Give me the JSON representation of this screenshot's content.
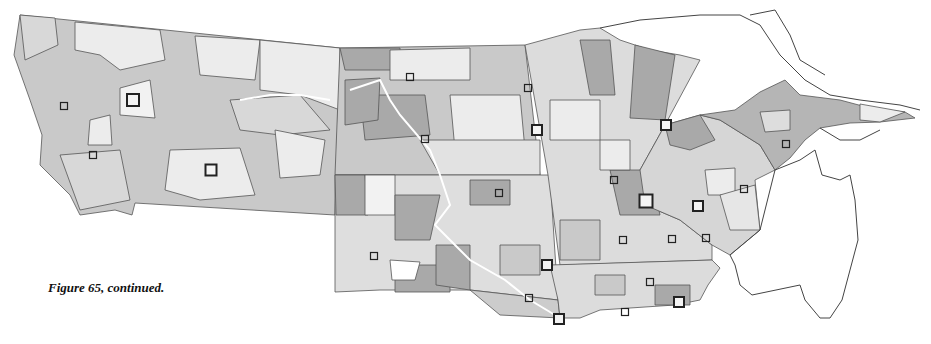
{
  "figure": {
    "caption": "Figure 65, continued.",
    "colors": {
      "dark": "#a9a9a9",
      "medium": "#c9c9c9",
      "light": "#ececec",
      "border": "#555555",
      "marker": "#222222"
    },
    "markers": [
      {
        "x": 133,
        "y": 100,
        "size": 12
      },
      {
        "x": 64,
        "y": 106,
        "size": 7
      },
      {
        "x": 93,
        "y": 155,
        "size": 7
      },
      {
        "x": 211,
        "y": 170,
        "size": 11
      },
      {
        "x": 410,
        "y": 77,
        "size": 7
      },
      {
        "x": 528,
        "y": 88,
        "size": 7
      },
      {
        "x": 425,
        "y": 139,
        "size": 7
      },
      {
        "x": 537,
        "y": 130,
        "size": 10
      },
      {
        "x": 666,
        "y": 125,
        "size": 10
      },
      {
        "x": 786,
        "y": 144,
        "size": 7
      },
      {
        "x": 614,
        "y": 180,
        "size": 7
      },
      {
        "x": 646,
        "y": 201,
        "size": 13
      },
      {
        "x": 698,
        "y": 206,
        "size": 10
      },
      {
        "x": 744,
        "y": 189,
        "size": 7
      },
      {
        "x": 499,
        "y": 193,
        "size": 7
      },
      {
        "x": 623,
        "y": 240,
        "size": 7
      },
      {
        "x": 672,
        "y": 239,
        "size": 7
      },
      {
        "x": 706,
        "y": 238,
        "size": 7
      },
      {
        "x": 374,
        "y": 256,
        "size": 7
      },
      {
        "x": 547,
        "y": 265,
        "size": 10
      },
      {
        "x": 650,
        "y": 282,
        "size": 7
      },
      {
        "x": 529,
        "y": 298,
        "size": 7
      },
      {
        "x": 679,
        "y": 302,
        "size": 10
      },
      {
        "x": 559,
        "y": 319,
        "size": 10
      },
      {
        "x": 625,
        "y": 312,
        "size": 7
      }
    ]
  }
}
